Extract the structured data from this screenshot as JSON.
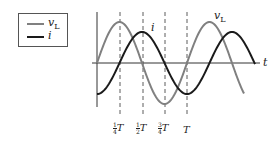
{
  "legend": {
    "items": [
      {
        "name": "v",
        "subscript": "L",
        "color": "#808080"
      },
      {
        "name": "i",
        "subscript": "",
        "color": "#1a1a1a"
      }
    ]
  },
  "axes": {
    "t_label": "t"
  },
  "curve_labels": {
    "vL": "v",
    "vL_sub": "L",
    "i": "i"
  },
  "ticks": [
    {
      "num": "1",
      "den": "4",
      "sym": "T"
    },
    {
      "num": "1",
      "den": "2",
      "sym": "T"
    },
    {
      "num": "3",
      "den": "4",
      "sym": "T"
    },
    {
      "num": "",
      "den": "",
      "sym": "T"
    }
  ],
  "colors": {
    "vL": "#808080",
    "i": "#1a1a1a",
    "axis": "#333333"
  },
  "chart_data": {
    "type": "line",
    "title": "",
    "xlabel": "t",
    "ylabel": "",
    "x_ticks": [
      "1/4 T",
      "1/2 T",
      "3/4 T",
      "T"
    ],
    "series": [
      {
        "name": "vL",
        "description": "sinusoid, starts at 0, peak at T/4",
        "phase": "sin",
        "amplitude": 1.3
      },
      {
        "name": "i",
        "description": "lags vL by 90°, minimum at t=0, peak at T/2",
        "phase": "-cos",
        "amplitude": 1.0
      }
    ],
    "x_range_periods": [
      0,
      1.75
    ]
  }
}
